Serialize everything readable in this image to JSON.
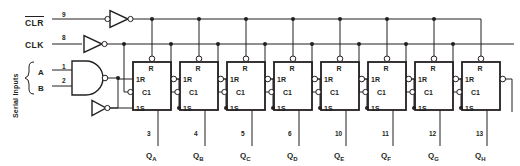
{
  "diagram": {
    "colors": {
      "line": "#231f20",
      "background": "#ffffff",
      "fill": "#ffffff"
    }
  },
  "inputs": {
    "clear": {
      "label": "CLR",
      "overbar": true,
      "pin": "9"
    },
    "clock": {
      "label": "CLK",
      "overbar": false,
      "pin": "8"
    },
    "serial_group_label": "Serial Inputs",
    "serial": [
      {
        "label": "A",
        "pin": "1"
      },
      {
        "label": "B",
        "pin": "2"
      }
    ]
  },
  "gates": {
    "nand_label": "NAND",
    "clear_inverter_label": "INV",
    "clock_inverter_label": "INV",
    "data_inverter_label": "INV"
  },
  "flipflop_pin_labels": {
    "reset": "R",
    "set_reset": "1R",
    "clock": "C1",
    "set": "1S"
  },
  "stages": [
    {
      "name": "QA",
      "out_label": "Q",
      "out_sub": "A",
      "pin": "3",
      "x": 133
    },
    {
      "name": "QB",
      "out_label": "Q",
      "out_sub": "B",
      "pin": "4",
      "x": 180
    },
    {
      "name": "QC",
      "out_label": "Q",
      "out_sub": "C",
      "pin": "5",
      "x": 227
    },
    {
      "name": "QD",
      "out_label": "Q",
      "out_sub": "D",
      "pin": "6",
      "x": 274
    },
    {
      "name": "QE",
      "out_label": "Q",
      "out_sub": "E",
      "pin": "10",
      "x": 321
    },
    {
      "name": "QF",
      "out_label": "Q",
      "out_sub": "F",
      "pin": "11",
      "x": 368
    },
    {
      "name": "QG",
      "out_label": "Q",
      "out_sub": "G",
      "pin": "12",
      "x": 415
    },
    {
      "name": "QH",
      "out_label": "Q",
      "out_sub": "H",
      "pin": "13",
      "x": 462
    }
  ]
}
